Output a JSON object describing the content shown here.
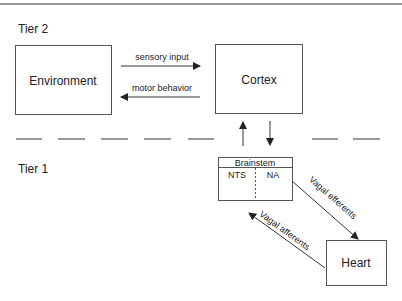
{
  "tiers": {
    "tier2_label": "Tier 2",
    "tier1_label": "Tier 1"
  },
  "nodes": {
    "environment": "Environment",
    "cortex": "Cortex",
    "brainstem": {
      "title": "Brainstem",
      "left": "NTS",
      "right": "NA"
    },
    "heart": "Heart"
  },
  "edges": {
    "sensory_input": "sensory input",
    "motor_behavior": "motor behavior",
    "vagal_efferents": "Vagal efferents",
    "vagal_afferents": "Vagal afferents"
  },
  "colors": {
    "line": "#333333",
    "frame": "#666666",
    "dash": "#555555"
  }
}
